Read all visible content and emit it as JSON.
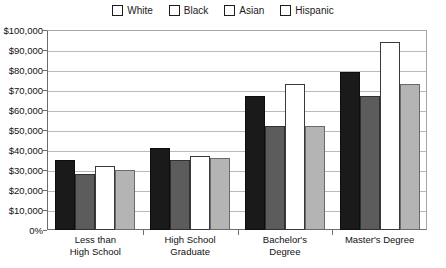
{
  "chart_data": {
    "type": "bar",
    "title": "",
    "xlabel": "",
    "ylabel": "",
    "ylim": [
      0,
      100000
    ],
    "grid": true,
    "legend_position": "top-center",
    "categories": [
      "Less than\nHigh School",
      "High School\nGraduate",
      "Bachelor's\nDegree",
      "Master's Degree"
    ],
    "category_lines": [
      [
        "Less than",
        "High School"
      ],
      [
        "High School",
        "Graduate"
      ],
      [
        "Bachelor's",
        "Degree"
      ],
      [
        "Master's Degree"
      ]
    ],
    "ytick_labels": [
      "$100,000",
      "$90,000",
      "$80,000",
      "$70,000",
      "$60,000",
      "$50,000",
      "$40,000",
      "$30,000",
      "$20,000",
      "$10,000",
      "0%"
    ],
    "ytick_values": [
      100000,
      90000,
      80000,
      70000,
      60000,
      50000,
      40000,
      30000,
      20000,
      10000,
      0
    ],
    "series": [
      {
        "name": "White",
        "color": "#1a1a1a",
        "values": [
          35000,
          41000,
          67000,
          79000
        ]
      },
      {
        "name": "Black",
        "color": "#5c5c5c",
        "values": [
          28000,
          35000,
          52000,
          67000
        ]
      },
      {
        "name": "Asian",
        "color": "#ffffff",
        "values": [
          32000,
          37000,
          73000,
          94000
        ]
      },
      {
        "name": "Hispanic",
        "color": "#b4b4b4",
        "values": [
          30000,
          36000,
          52000,
          73000
        ]
      }
    ]
  }
}
